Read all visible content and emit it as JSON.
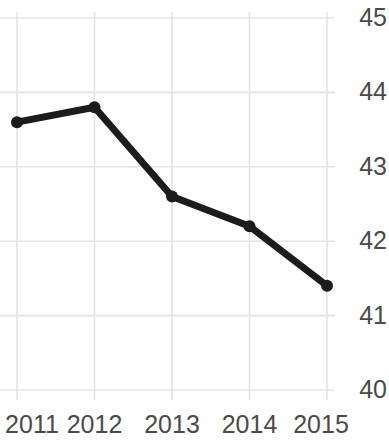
{
  "chart_data": {
    "type": "line",
    "title": "",
    "title_clipped_remnant": "",
    "xlabel": "",
    "ylabel": "",
    "categories": [
      "2011",
      "2012",
      "2013",
      "2014",
      "2015"
    ],
    "x": [
      2011,
      2012,
      2013,
      2014,
      2015
    ],
    "values": [
      43.6,
      43.8,
      42.6,
      42.2,
      41.4
    ],
    "series": [
      {
        "name": "",
        "values": [
          43.6,
          43.8,
          42.6,
          42.2,
          41.4
        ]
      }
    ],
    "ylim": [
      40,
      45
    ],
    "xlim": [
      2011,
      2015
    ],
    "y_ticks": [
      45,
      44,
      43,
      42,
      41,
      40
    ],
    "y_tick_labels": [
      "45",
      "44",
      "43",
      "42",
      "41",
      "40"
    ],
    "x_ticks": [
      2011,
      2012,
      2013,
      2014,
      2015
    ],
    "x_tick_labels": [
      "2011",
      "2012",
      "2013",
      "2014",
      "2015"
    ],
    "grid": true,
    "grid_horizontal": true,
    "grid_vertical": true,
    "legend": false,
    "legend_position": "none",
    "markers": true,
    "marker_shape": "circle",
    "annotations": [],
    "colors": {
      "line": "#1c1c1c",
      "marker": "#1c1c1c",
      "grid": "#e4e4e6",
      "tick_label": "#4a4a4a",
      "background": "#ffffff"
    },
    "style": {
      "line_width_px": 7,
      "marker_radius_px": 6,
      "y_axis_side": "right",
      "axis_line": false
    }
  },
  "y_axis": {
    "ticks": [
      {
        "label": "45",
        "value": 45
      },
      {
        "label": "44",
        "value": 44
      },
      {
        "label": "43",
        "value": 43
      },
      {
        "label": "42",
        "value": 42
      },
      {
        "label": "41",
        "value": 41
      },
      {
        "label": "40",
        "value": 40
      }
    ]
  },
  "x_axis": {
    "ticks": [
      {
        "label": "2011",
        "value": 2011
      },
      {
        "label": "2012",
        "value": 2012
      },
      {
        "label": "2013",
        "value": 2013
      },
      {
        "label": "2014",
        "value": 2014
      },
      {
        "label": "2015",
        "value": 2015
      }
    ]
  }
}
